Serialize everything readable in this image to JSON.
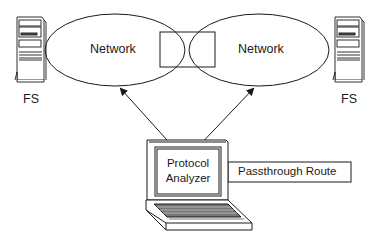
{
  "diagram": {
    "networks": [
      {
        "label": "Network"
      },
      {
        "label": "Network"
      }
    ],
    "file_servers": [
      {
        "label": "FS"
      },
      {
        "label": "FS"
      }
    ],
    "analyzer": {
      "line1": "Protocol",
      "line2": "Analyzer"
    },
    "passthrough": {
      "label": "Passthrough Route"
    },
    "colors": {
      "stroke": "#1a1a1a",
      "background": "#ffffff"
    }
  }
}
